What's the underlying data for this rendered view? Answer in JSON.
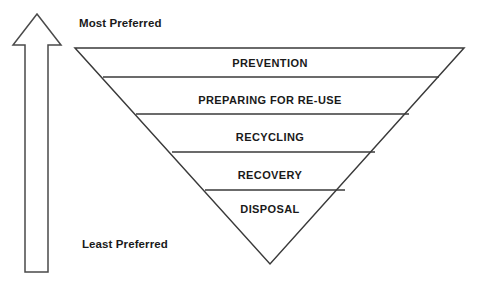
{
  "diagram": {
    "type": "inverted-triangle-hierarchy",
    "background_color": "#ffffff",
    "line_color": "#3a3a3a",
    "text_color": "#1a1a1a",
    "top_label": "Most Preferred",
    "bottom_label": "Least Preferred",
    "arrow": {
      "name": "preference-arrow",
      "direction": "up",
      "style": "outline",
      "fill_color": "#ffffff",
      "stroke_color": "#4a4a4a"
    },
    "levels": [
      {
        "rank": 1,
        "label": "PREVENTION"
      },
      {
        "rank": 2,
        "label": "PREPARING FOR RE-USE"
      },
      {
        "rank": 3,
        "label": "RECYCLING"
      },
      {
        "rank": 4,
        "label": "RECOVERY"
      },
      {
        "rank": 5,
        "label": "DISPOSAL"
      }
    ]
  }
}
